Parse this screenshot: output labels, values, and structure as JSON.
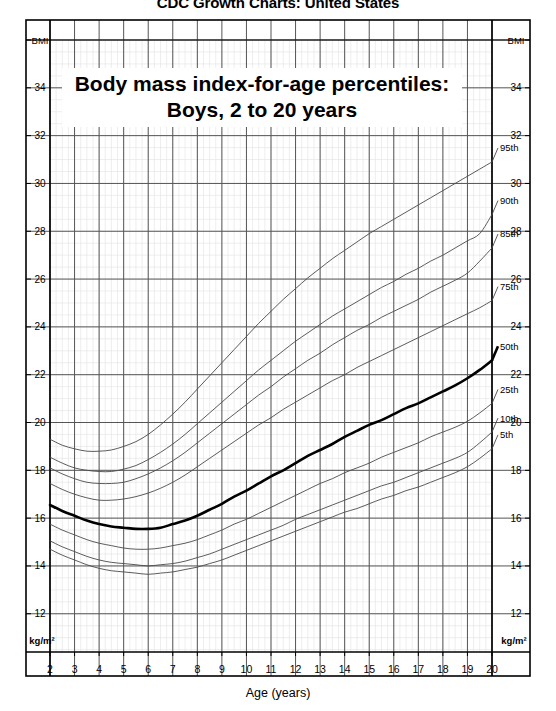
{
  "document": {
    "header_title": "CDC Growth Charts: United States"
  },
  "chart_titles": {
    "line1": "Body mass index-for-age percentiles:",
    "line2": "Boys, 2 to 20 years"
  },
  "axes": {
    "x_axis_label": "Age (years)",
    "y_axis_top_label": "BMI",
    "y_axis_unit_label": "kg/m²",
    "x_ticks": [
      "2",
      "3",
      "4",
      "5",
      "6",
      "7",
      "8",
      "9",
      "10",
      "11",
      "12",
      "13",
      "14",
      "15",
      "16",
      "17",
      "18",
      "19",
      "20"
    ],
    "y_ticks": [
      "34",
      "32",
      "30",
      "28",
      "26",
      "24",
      "22",
      "20",
      "18",
      "16",
      "14",
      "12"
    ],
    "xlim": [
      2,
      20
    ],
    "ylim": [
      10.4,
      36.0
    ],
    "x_major_step": 1,
    "x_minor_step": 0.25,
    "y_major_step": 2,
    "y_minor_step": 0.5,
    "grid": true
  },
  "colors": {
    "grid_major": "#555555",
    "grid_minor": "#e2e2e2",
    "frame": "#000000",
    "curve": "#4a4a4a",
    "curve_median": "#000000",
    "text": "#000000",
    "background": "#ffffff"
  },
  "chart_data": {
    "type": "line",
    "title": "Body mass index-for-age percentiles: Boys, 2 to 20 years",
    "subtitle": "CDC Growth Charts: United States",
    "xlabel": "Age (years)",
    "ylabel": "BMI",
    "yunit": "kg/m²",
    "xlim": [
      2,
      20
    ],
    "ylim": [
      10.4,
      36.0
    ],
    "grid": true,
    "legend_position": "right-inline-labels",
    "x": [
      2,
      2.5,
      3,
      3.5,
      4,
      4.5,
      5,
      5.5,
      6,
      6.5,
      7,
      7.5,
      8,
      8.5,
      9,
      9.5,
      10,
      10.5,
      11,
      11.5,
      12,
      12.5,
      13,
      13.5,
      14,
      14.5,
      15,
      15.5,
      16,
      16.5,
      17,
      17.5,
      18,
      18.5,
      19,
      19.5,
      20
    ],
    "series": [
      {
        "name": "95th",
        "label": "95th",
        "emphasis": false,
        "values": [
          19.3,
          19.05,
          18.9,
          18.8,
          18.8,
          18.85,
          19.0,
          19.2,
          19.5,
          19.9,
          20.35,
          20.85,
          21.4,
          21.95,
          22.5,
          23.05,
          23.6,
          24.15,
          24.65,
          25.15,
          25.6,
          26.05,
          26.45,
          26.85,
          27.2,
          27.55,
          27.9,
          28.2,
          28.5,
          28.8,
          29.1,
          29.4,
          29.7,
          30.0,
          30.3,
          30.6,
          30.9
        ]
      },
      {
        "name": "90th",
        "label": "90th",
        "emphasis": false,
        "values": [
          18.55,
          18.3,
          18.1,
          18.0,
          17.95,
          17.95,
          18.05,
          18.2,
          18.45,
          18.75,
          19.1,
          19.5,
          19.95,
          20.4,
          20.85,
          21.3,
          21.75,
          22.2,
          22.6,
          23.0,
          23.4,
          23.75,
          24.1,
          24.45,
          24.75,
          25.05,
          25.35,
          25.65,
          25.9,
          26.2,
          26.45,
          26.75,
          27.0,
          27.3,
          27.6,
          27.9,
          28.7
        ]
      },
      {
        "name": "85th",
        "label": "85th",
        "emphasis": false,
        "values": [
          18.1,
          17.85,
          17.65,
          17.5,
          17.45,
          17.45,
          17.5,
          17.65,
          17.85,
          18.1,
          18.4,
          18.75,
          19.15,
          19.55,
          19.95,
          20.35,
          20.75,
          21.15,
          21.5,
          21.9,
          22.25,
          22.6,
          22.9,
          23.25,
          23.55,
          23.85,
          24.1,
          24.4,
          24.65,
          24.9,
          25.15,
          25.45,
          25.7,
          25.95,
          26.25,
          26.75,
          27.3
        ]
      },
      {
        "name": "75th",
        "label": "75th",
        "emphasis": false,
        "values": [
          17.45,
          17.2,
          17.0,
          16.85,
          16.75,
          16.75,
          16.8,
          16.9,
          17.05,
          17.25,
          17.5,
          17.8,
          18.15,
          18.5,
          18.85,
          19.2,
          19.55,
          19.9,
          20.2,
          20.55,
          20.85,
          21.15,
          21.45,
          21.75,
          22.0,
          22.3,
          22.55,
          22.8,
          23.05,
          23.3,
          23.55,
          23.8,
          24.05,
          24.3,
          24.55,
          24.8,
          25.1
        ]
      },
      {
        "name": "50th",
        "label": "50th",
        "emphasis": true,
        "values": [
          16.55,
          16.3,
          16.1,
          15.9,
          15.75,
          15.65,
          15.6,
          15.55,
          15.55,
          15.6,
          15.75,
          15.9,
          16.1,
          16.35,
          16.6,
          16.9,
          17.15,
          17.45,
          17.75,
          18.0,
          18.3,
          18.6,
          18.85,
          19.1,
          19.4,
          19.65,
          19.9,
          20.1,
          20.35,
          20.6,
          20.8,
          21.05,
          21.3,
          21.55,
          21.85,
          22.2,
          22.6
        ]
      },
      {
        "name": "25th",
        "label": "25th",
        "emphasis": false,
        "values": [
          15.75,
          15.5,
          15.3,
          15.1,
          14.95,
          14.85,
          14.75,
          14.7,
          14.7,
          14.75,
          14.85,
          14.95,
          15.1,
          15.3,
          15.5,
          15.75,
          15.95,
          16.2,
          16.45,
          16.7,
          16.95,
          17.2,
          17.45,
          17.65,
          17.9,
          18.1,
          18.3,
          18.55,
          18.75,
          18.95,
          19.15,
          19.4,
          19.6,
          19.8,
          20.05,
          20.4,
          20.8
        ]
      },
      {
        "name": "10th",
        "label": "10th",
        "emphasis": false,
        "values": [
          15.05,
          14.8,
          14.6,
          14.4,
          14.25,
          14.15,
          14.1,
          14.05,
          14.0,
          14.05,
          14.1,
          14.2,
          14.35,
          14.5,
          14.7,
          14.9,
          15.1,
          15.3,
          15.5,
          15.7,
          15.95,
          16.15,
          16.35,
          16.55,
          16.75,
          16.95,
          17.15,
          17.35,
          17.5,
          17.7,
          17.9,
          18.1,
          18.3,
          18.5,
          18.75,
          19.15,
          19.6
        ]
      },
      {
        "name": "5th",
        "label": "5th",
        "emphasis": false,
        "values": [
          14.7,
          14.45,
          14.25,
          14.05,
          13.9,
          13.8,
          13.75,
          13.7,
          13.65,
          13.7,
          13.75,
          13.85,
          13.95,
          14.1,
          14.25,
          14.45,
          14.65,
          14.85,
          15.05,
          15.25,
          15.45,
          15.65,
          15.85,
          16.05,
          16.25,
          16.4,
          16.6,
          16.8,
          16.95,
          17.15,
          17.3,
          17.5,
          17.7,
          17.9,
          18.15,
          18.5,
          18.9
        ]
      }
    ],
    "percentile_labels": [
      "95th",
      "90th",
      "85th",
      "75th",
      "50th",
      "25th",
      "10th",
      "5th"
    ]
  }
}
